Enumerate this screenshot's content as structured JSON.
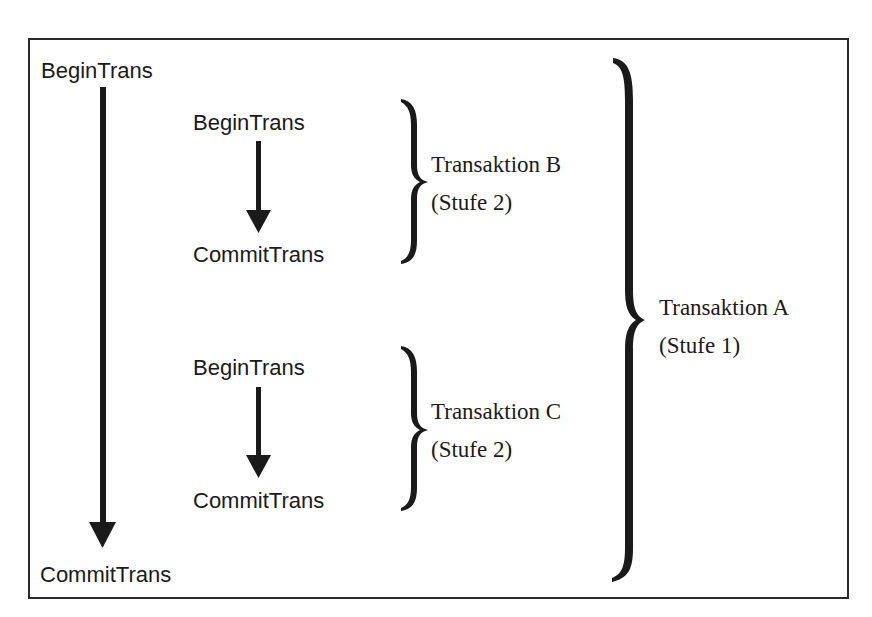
{
  "diagram": {
    "type": "nested-transactions",
    "outer": {
      "begin_label": "BeginTrans",
      "commit_label": "CommitTrans",
      "brace_label_line1": "Transaktion A",
      "brace_label_line2": "(Stufe 1)"
    },
    "inner": [
      {
        "begin_label": "BeginTrans",
        "commit_label": "CommitTrans",
        "brace_label_line1": "Transaktion B",
        "brace_label_line2": "(Stufe 2)"
      },
      {
        "begin_label": "BeginTrans",
        "commit_label": "CommitTrans",
        "brace_label_line1": "Transaktion C",
        "brace_label_line2": "(Stufe 2)"
      }
    ],
    "colors": {
      "stroke": "#1a1a1a",
      "background": "#ffffff"
    }
  }
}
